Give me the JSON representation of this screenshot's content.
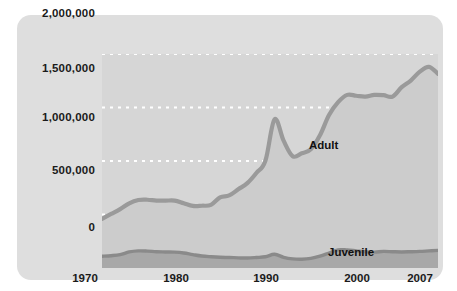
{
  "chart_data": {
    "type": "area",
    "stacked": true,
    "title": "",
    "subtitle": "",
    "xlabel": "",
    "ylabel": "",
    "xlim": [
      1970,
      2007
    ],
    "ylim": [
      0,
      2000000
    ],
    "grid": true,
    "gridlines_horizontal": [
      0,
      500000,
      1000000,
      1500000,
      2000000
    ],
    "legend_position": "inline-annotation",
    "ytick_labels": [
      "2,000,000",
      "1,500,000",
      "1,000,000",
      "500,000",
      "0"
    ],
    "ytick_values": [
      2000000,
      1500000,
      1000000,
      500000,
      0
    ],
    "xtick_labels": [
      "1970",
      "1980",
      "1990",
      "2000",
      "2007"
    ],
    "xtick_values": [
      1970,
      1980,
      1990,
      2000,
      2007
    ],
    "annotations": [
      {
        "text": "Adult",
        "x": 1997,
        "y": 1080000
      },
      {
        "text": "Juvenile",
        "x": 2000,
        "y": 95000
      }
    ],
    "x": [
      1970,
      1971,
      1972,
      1973,
      1974,
      1975,
      1976,
      1977,
      1978,
      1979,
      1980,
      1981,
      1982,
      1983,
      1984,
      1985,
      1986,
      1987,
      1988,
      1989,
      1990,
      1991,
      1992,
      1993,
      1994,
      1995,
      1996,
      1997,
      1998,
      1999,
      2000,
      2001,
      2002,
      2003,
      2004,
      2005,
      2006,
      2007
    ],
    "series": [
      {
        "name": "Juvenile",
        "color": "#a8a8a8",
        "stroke": "#8a8a8a",
        "values": [
          110000,
          115000,
          125000,
          150000,
          160000,
          158000,
          152000,
          150000,
          148000,
          140000,
          125000,
          112000,
          105000,
          100000,
          98000,
          95000,
          93000,
          98000,
          105000,
          128000,
          100000,
          85000,
          82000,
          90000,
          110000,
          140000,
          170000,
          168000,
          160000,
          152000,
          148000,
          155000,
          152000,
          150000,
          152000,
          155000,
          160000,
          165000
        ]
      },
      {
        "name": "Adult",
        "color": "#cccccc",
        "stroke": "#9a9a9a",
        "values": [
          350000,
          390000,
          425000,
          455000,
          475000,
          480000,
          478000,
          480000,
          482000,
          465000,
          455000,
          470000,
          485000,
          560000,
          580000,
          640000,
          700000,
          790000,
          900000,
          1260000,
          1090000,
          960000,
          990000,
          1020000,
          1130000,
          1290000,
          1380000,
          1450000,
          1450000,
          1450000,
          1470000,
          1460000,
          1450000,
          1540000,
          1600000,
          1680000,
          1720000,
          1650000
        ]
      }
    ]
  },
  "axis": {
    "y_labels": [
      "2,000,000",
      "1,500,000",
      "1,000,000",
      "500,000",
      "0"
    ],
    "x_labels": [
      "1970",
      "1980",
      "1990",
      "2000",
      "2007"
    ]
  },
  "labels": {
    "adult": "Adult",
    "juvenile": "Juvenile"
  },
  "colors": {
    "card_background": "#dedede",
    "plot_background": "#d6d6d6",
    "adult_fill": "#cccccc",
    "adult_stroke": "#9a9a9a",
    "juvenile_fill": "#a8a8a8",
    "juvenile_stroke": "#8a8a8a",
    "gridline": "#ffffff",
    "text": "#1a1a1a"
  }
}
